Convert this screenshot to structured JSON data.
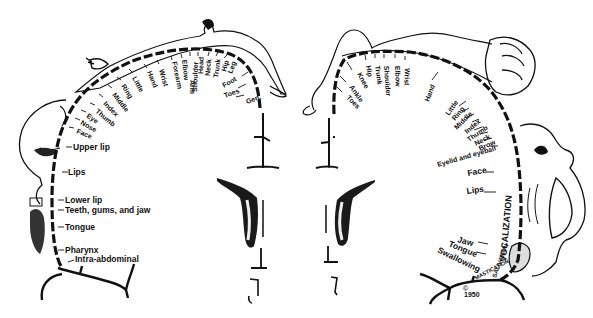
{
  "diagram": {
    "type": "cortical homunculus illustration",
    "left_panel": {
      "name": "sensory homunculus",
      "labels_along_arc": [
        "Gen.",
        "Toes",
        "Foot",
        "Leg",
        "Hip",
        "Trunk",
        "Neck",
        "Head",
        "Shoulder",
        "Arm",
        "Elbow",
        "Forearm",
        "Wrist",
        "Hand",
        "Little",
        "Ring",
        "Middle",
        "Index",
        "Thumb",
        "Eye",
        "Nose",
        "Face"
      ],
      "labels_vertical": [
        "Upper lip",
        "Lips",
        "Lower lip",
        "Teeth, gums, and jaw",
        "Tongue",
        "Pharynx",
        "Intra-abdominal"
      ]
    },
    "right_panel": {
      "name": "motor homunculus",
      "labels_along_arc": [
        "Toes",
        "Ankle",
        "Knee",
        "Hip",
        "Trunk",
        "Shoulder",
        "Elbow",
        "Wrist",
        "Hand",
        "Little",
        "Ring",
        "Middle",
        "Index",
        "Thumb",
        "Neck",
        "Brow",
        "Eyelid and eyeball"
      ],
      "labels_vertical": [
        "Face",
        "Lips",
        "Jaw",
        "Tongue",
        "Swallowing"
      ],
      "labels_rotated": [
        "VOCALIZATION",
        "SALIVATION",
        "MASTICATION"
      ]
    },
    "signatures": [
      "©",
      "1950"
    ]
  }
}
